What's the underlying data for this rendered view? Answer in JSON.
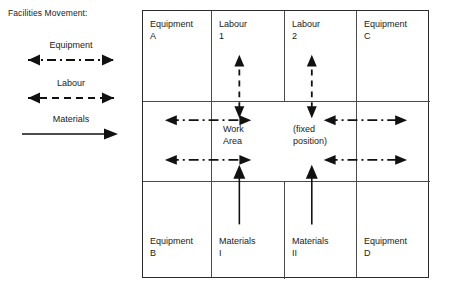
{
  "legend": {
    "title": "Facilities Movement:",
    "items": [
      {
        "label": "Equipment",
        "line_style": "dash-dot",
        "heads": "both"
      },
      {
        "label": "Labour",
        "line_style": "dashed",
        "heads": "both"
      },
      {
        "label": "Materials",
        "line_style": "solid",
        "heads": "right"
      }
    ]
  },
  "diagram": {
    "top_row": [
      {
        "line1": "Equipment",
        "line2": "A"
      },
      {
        "line1": "Labour",
        "line2": "1"
      },
      {
        "line1": "Labour",
        "line2": "2"
      },
      {
        "line1": "Equipment",
        "line2": "C"
      }
    ],
    "bottom_row": [
      {
        "line1": "Equipment",
        "line2": "B"
      },
      {
        "line1": "Materials",
        "line2": "I"
      },
      {
        "line1": "Materials",
        "line2": "II"
      },
      {
        "line1": "Equipment",
        "line2": "D"
      }
    ],
    "center_band": [
      {
        "line1": "Work",
        "line2": "Area"
      },
      {
        "line1": "(fixed",
        "line2": "position)"
      }
    ],
    "flows": {
      "equipment_left_upper": "Equipment A to Work Area",
      "equipment_left_lower": "Equipment B to Work Area",
      "equipment_right_upper": "Equipment C to Work Area",
      "equipment_right_lower": "Equipment D to Work Area",
      "labour_1": "Labour 1 to Work Area",
      "labour_2": "Labour 2 to fixed position",
      "materials_1": "Materials I to Work Area",
      "materials_2": "Materials II to fixed position"
    }
  },
  "colors": {
    "ink": "#1a1a1a",
    "rule": "#4a4a4a",
    "border": "#2b2b2b",
    "background": "#ffffff"
  }
}
